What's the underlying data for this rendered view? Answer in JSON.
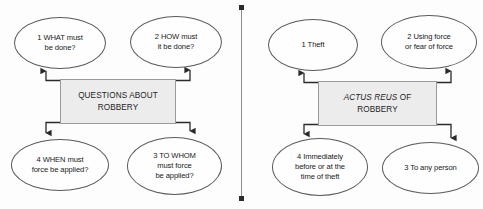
{
  "figure": {
    "type": "two-panel-flowchart",
    "divider": {
      "name": "vertical-divider",
      "color": "#8c8c8c",
      "cap_color": "#2b2b2b"
    },
    "box_fill": "#ececec",
    "node_fill": "#fefefe",
    "stroke": "#5a5a5a"
  },
  "left_panel": {
    "center": {
      "line1": "QUESTIONS ABOUT",
      "line2": "ROBBERY"
    },
    "nodes": [
      {
        "id": "1",
        "lines": [
          "1  WHAT must",
          "be done?"
        ]
      },
      {
        "id": "2",
        "lines": [
          "2  HOW must",
          "it be done?"
        ]
      },
      {
        "id": "4",
        "lines": [
          "4  WHEN must",
          "force be applied?"
        ]
      },
      {
        "id": "3",
        "lines": [
          "3  TO WHOM",
          "must force",
          "be applied?"
        ]
      }
    ]
  },
  "right_panel": {
    "center": {
      "italic": "ACTUS REUS",
      "roman_suffix": " OF",
      "line2": "ROBBERY"
    },
    "nodes": [
      {
        "id": "1",
        "lines": [
          "1  Theft"
        ]
      },
      {
        "id": "2",
        "lines": [
          "2  Using force",
          "or fear of force"
        ]
      },
      {
        "id": "4",
        "lines": [
          "4  Immediately",
          "before or at the",
          "time of theft"
        ]
      },
      {
        "id": "3",
        "lines": [
          "3  To any person"
        ]
      }
    ]
  }
}
